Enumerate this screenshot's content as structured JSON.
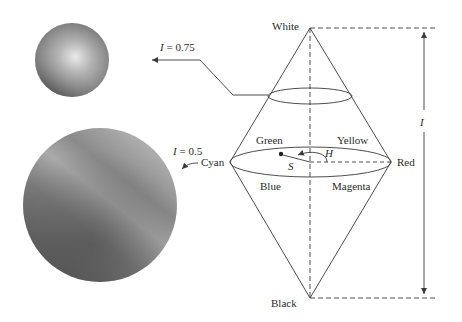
{
  "diagram": {
    "vertices": {
      "top": "White",
      "bottom": "Black"
    },
    "hue_circle_labels": {
      "left": "Cyan",
      "right": "Red",
      "upper_left": "Green",
      "upper_right": "Yellow",
      "lower_left": "Blue",
      "lower_right": "Magenta"
    },
    "parameters": {
      "hue": "H",
      "saturation": "S",
      "intensity": "I"
    },
    "slices": [
      {
        "label": "I = 0.75",
        "var": "I",
        "value": "0.75"
      },
      {
        "label": "I = 0.5",
        "var": "I",
        "value": "0.5"
      }
    ],
    "colors": {
      "line": "#3a3a3a",
      "text": "#2a2a2a",
      "background": "#ffffff"
    }
  }
}
